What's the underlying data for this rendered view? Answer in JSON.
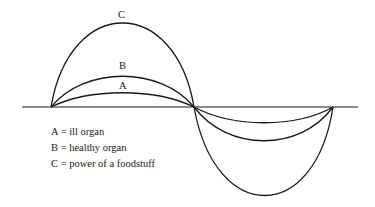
{
  "diagram": {
    "type": "sine-wave-amplitude-comparison",
    "curves": [
      {
        "id": "A",
        "label": "A",
        "meaning": "ill organ",
        "relative_amplitude": "small"
      },
      {
        "id": "B",
        "label": "B",
        "meaning": "healthy organ",
        "relative_amplitude": "medium"
      },
      {
        "id": "C",
        "label": "C",
        "meaning": "power of a foodstuff",
        "relative_amplitude": "large"
      }
    ],
    "curve_labels": {
      "A": "A",
      "B": "B",
      "C": "C"
    },
    "legend": [
      {
        "text": "A = ill organ"
      },
      {
        "text": "B = healthy organ"
      },
      {
        "text": "C = power of a foodstuff"
      }
    ],
    "colors": {
      "line": "#1a1a1a",
      "background": "#ffffff"
    }
  }
}
